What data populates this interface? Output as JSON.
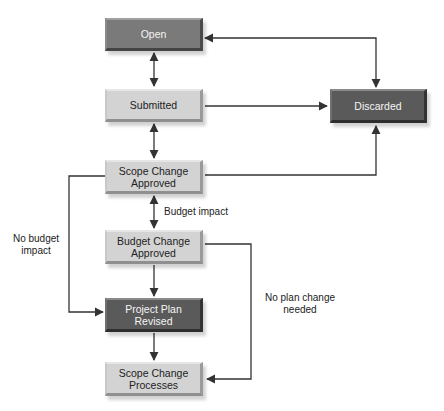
{
  "nodes": {
    "open": {
      "label": "Open",
      "tone": "mid"
    },
    "submitted": {
      "label": "Submitted",
      "tone": "light"
    },
    "discarded": {
      "label": "Discarded",
      "tone": "dark"
    },
    "scope_change_approved": {
      "label": "Scope Change\nApproved",
      "tone": "light"
    },
    "budget_change_approved": {
      "label": "Budget Change\nApproved",
      "tone": "light"
    },
    "project_plan_revised": {
      "label": "Project Plan\nRevised",
      "tone": "dark"
    },
    "scope_change_processes": {
      "label": "Scope Change\nProcesses",
      "tone": "light"
    }
  },
  "edge_labels": {
    "budget_impact": "Budget impact",
    "no_budget_impact": "No budget\nimpact",
    "no_plan_change": "No plan change\nneeded"
  },
  "edges": [
    {
      "from": "open",
      "to": "submitted",
      "bidirectional": true
    },
    {
      "from": "submitted",
      "to": "scope_change_approved",
      "bidirectional": true
    },
    {
      "from": "scope_change_approved",
      "to": "budget_change_approved",
      "bidirectional": true,
      "label": "Budget impact"
    },
    {
      "from": "budget_change_approved",
      "to": "project_plan_revised",
      "bidirectional": false
    },
    {
      "from": "project_plan_revised",
      "to": "scope_change_processes",
      "bidirectional": false
    },
    {
      "from": "open",
      "to": "discarded",
      "bidirectional": true
    },
    {
      "from": "submitted",
      "to": "discarded",
      "bidirectional": false
    },
    {
      "from": "scope_change_approved",
      "to": "discarded",
      "bidirectional": false
    },
    {
      "from": "scope_change_approved",
      "to": "project_plan_revised",
      "bidirectional": false,
      "label": "No budget impact"
    },
    {
      "from": "budget_change_approved",
      "to": "scope_change_processes",
      "bidirectional": false,
      "label": "No plan change needed"
    }
  ],
  "colors": {
    "line": "#333333",
    "light_box": "#d3d3d3",
    "mid_box": "#7a7a7a",
    "dark_box": "#5a5a5a"
  }
}
